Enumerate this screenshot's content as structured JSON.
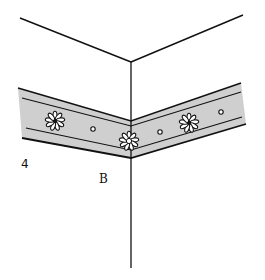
{
  "figure": {
    "labels": {
      "number": "4",
      "point": "B"
    },
    "colors": {
      "line": "#111111",
      "band_fill": "#cfcfcf",
      "background": "#ffffff",
      "flower_fill": "#ffffff"
    },
    "elements": {
      "ceiling_wall_corner": "two walls meeting at a vertical corner line",
      "border_band": "decorative wallpaper border strip wrapping around the corner",
      "flowers": [
        "flower-left",
        "flower-corner",
        "flower-right"
      ],
      "dots": [
        "dot-1",
        "dot-2",
        "dot-3"
      ]
    }
  }
}
